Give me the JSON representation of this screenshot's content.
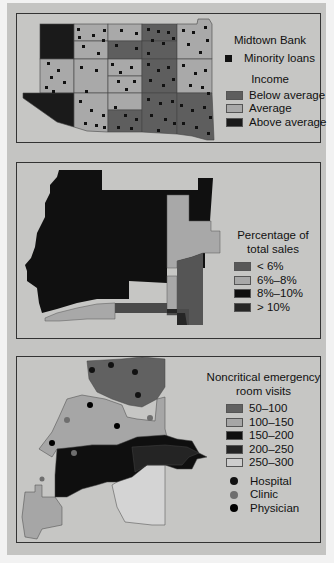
{
  "panels": [
    {
      "id": "midtown-bank",
      "legend": {
        "title": "Midtown Bank",
        "marker": {
          "icon": "square-marker-icon",
          "label": "Minority loans",
          "color": "#111111"
        },
        "section_title": "Income",
        "classes": [
          {
            "label": "Below average",
            "color": "#5e5e5e"
          },
          {
            "label": "Average",
            "color": "#a9a9a9"
          },
          {
            "label": "Above average",
            "color": "#1a1a1a"
          }
        ]
      }
    },
    {
      "id": "sales-share",
      "legend": {
        "title_line1": "Percentage of",
        "title_line2": "total sales",
        "classes": [
          {
            "label": "< 6%",
            "color": "#585858"
          },
          {
            "label": "6%–8%",
            "color": "#a8a8a8"
          },
          {
            "label": "8%–10%",
            "color": "#0e0e0e"
          },
          {
            "label": "> 10%",
            "color": "#262626"
          }
        ]
      }
    },
    {
      "id": "er-visits",
      "legend": {
        "title_line1": "Noncritical emergency",
        "title_line2": "room visits",
        "classes": [
          {
            "label": "50–100",
            "color": "#616161"
          },
          {
            "label": "100–150",
            "color": "#a6a6a6"
          },
          {
            "label": "150–200",
            "color": "#0f0f0f"
          },
          {
            "label": "200–250",
            "color": "#242424"
          },
          {
            "label": "250–300",
            "color": "#cdcdcd"
          }
        ],
        "points": [
          {
            "icon": "hospital-dot-icon",
            "label": "Hospital",
            "color": "#111111"
          },
          {
            "icon": "clinic-dot-icon",
            "label": "Clinic",
            "color": "#6e6e6e"
          },
          {
            "icon": "physician-dot-icon",
            "label": "Physician",
            "color": "#000000"
          }
        ]
      }
    }
  ],
  "colors": {
    "page_background": "#c4c4c2",
    "panel_border": "#333333"
  }
}
